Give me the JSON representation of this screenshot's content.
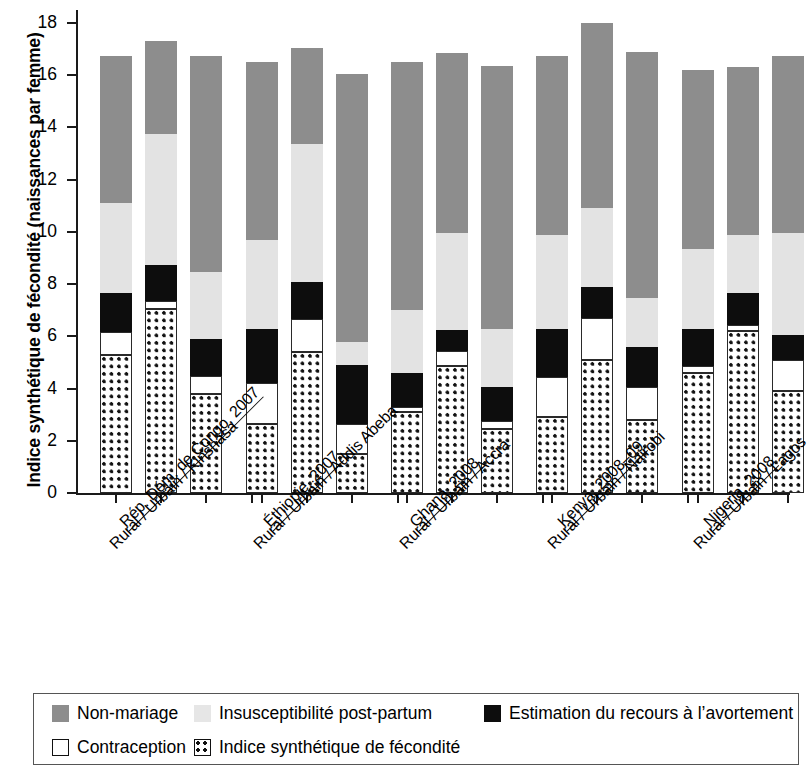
{
  "chart_data": {
    "type": "bar",
    "stacked": true,
    "title": "",
    "xlabel": "",
    "ylabel": "Indice synthétique de fécondité (naissances par femme)",
    "ylim": [
      0,
      18
    ],
    "yticks": [
      0,
      2,
      4,
      6,
      8,
      10,
      12,
      14,
      16,
      18
    ],
    "grid": false,
    "legend_position": "bottom",
    "series": [
      {
        "name": "Indice synthétique de fécondité",
        "key": "tfr",
        "color": "#ffffff",
        "pattern": "dotted-grid"
      },
      {
        "name": "Contraception",
        "key": "contraception",
        "color": "#ffffff",
        "pattern": "solid-outline"
      },
      {
        "name": "Estimation du recours à l’avortement",
        "key": "abortion",
        "color": "#0d0d0d",
        "pattern": "solid-black"
      },
      {
        "name": "Insusceptibilité post-partum",
        "key": "postpartum",
        "color": "#e3e3e3",
        "pattern": "light-stipple"
      },
      {
        "name": "Non-mariage",
        "key": "nonmarriage",
        "color": "#8d8d8d",
        "pattern": "dark-stipple"
      }
    ],
    "groups": [
      {
        "label_country": "Rép. Dém. de Congo, 2007",
        "label_bars": "Rural / Urbain / Kinshasa",
        "bars": [
          {
            "name": "Rural",
            "tfr": 5.3,
            "contraception": 0.85,
            "abortion": 1.5,
            "postpartum": 3.45,
            "nonmarriage": 5.65,
            "total": 16.75
          },
          {
            "name": "Urbain",
            "tfr": 7.05,
            "contraception": 0.3,
            "abortion": 1.4,
            "postpartum": 5.0,
            "nonmarriage": 3.55,
            "total": 17.3
          },
          {
            "name": "Kinshasa",
            "tfr": 3.8,
            "contraception": 0.7,
            "abortion": 1.4,
            "postpartum": 2.55,
            "nonmarriage": 8.3,
            "total": 16.75
          }
        ]
      },
      {
        "label_country": "Éthiopie, 2007",
        "label_bars": "Rural / Urbain / Addis Abeba",
        "bars": [
          {
            "name": "Rural",
            "tfr": 2.65,
            "contraception": 1.55,
            "abortion": 2.1,
            "postpartum": 3.4,
            "nonmarriage": 6.8,
            "total": 16.5
          },
          {
            "name": "Urbain",
            "tfr": 5.4,
            "contraception": 1.25,
            "abortion": 1.45,
            "postpartum": 5.25,
            "nonmarriage": 3.7,
            "total": 17.05
          },
          {
            "name": "Addis Abeba",
            "tfr": 1.5,
            "contraception": 1.15,
            "abortion": 2.25,
            "postpartum": 0.9,
            "nonmarriage": 10.25,
            "total": 16.05
          }
        ]
      },
      {
        "label_country": "Ghana, 2008",
        "label_bars": "Rural / Urbain / Accra",
        "bars": [
          {
            "name": "Rural",
            "tfr": 3.1,
            "contraception": 0.2,
            "abortion": 1.3,
            "postpartum": 2.4,
            "nonmarriage": 9.5,
            "total": 16.5
          },
          {
            "name": "Urbain",
            "tfr": 4.85,
            "contraception": 0.6,
            "abortion": 0.8,
            "postpartum": 3.7,
            "nonmarriage": 6.9,
            "total": 16.85
          },
          {
            "name": "Accra",
            "tfr": 2.45,
            "contraception": 0.3,
            "abortion": 1.3,
            "postpartum": 2.25,
            "nonmarriage": 10.05,
            "total": 16.35
          }
        ]
      },
      {
        "label_country": "Kenya, 2008–09",
        "label_bars": "Rural / Urbain / Nairobi",
        "bars": [
          {
            "name": "Rural",
            "tfr": 2.9,
            "contraception": 1.55,
            "abortion": 1.85,
            "postpartum": 3.6,
            "nonmarriage": 6.85,
            "total": 16.75
          },
          {
            "name": "Urbain",
            "tfr": 5.1,
            "contraception": 1.6,
            "abortion": 1.2,
            "postpartum": 3.0,
            "nonmarriage": 7.1,
            "total": 18.0
          },
          {
            "name": "Nairobi",
            "tfr": 2.8,
            "contraception": 1.25,
            "abortion": 1.55,
            "postpartum": 1.85,
            "nonmarriage": 9.45,
            "total": 16.9
          }
        ]
      },
      {
        "label_country": "Nigeria, 2008",
        "label_bars": "Rural / Urbain / Lagos",
        "bars": [
          {
            "name": "Rural",
            "tfr": 4.6,
            "contraception": 0.25,
            "abortion": 1.45,
            "postpartum": 3.05,
            "nonmarriage": 6.85,
            "total": 16.2
          },
          {
            "name": "Urbain",
            "tfr": 6.2,
            "contraception": 0.25,
            "abortion": 1.2,
            "postpartum": 2.25,
            "nonmarriage": 6.4,
            "total": 16.3
          },
          {
            "name": "Lagos",
            "tfr": 3.9,
            "contraception": 1.2,
            "abortion": 0.95,
            "postpartum": 3.9,
            "nonmarriage": 6.8,
            "total": 16.75
          }
        ]
      }
    ]
  },
  "axis": {
    "y_title": "Indice synthétique de fécondité (naissances par femme)",
    "tick_0": "0",
    "tick_2": "2",
    "tick_4": "4",
    "tick_6": "6",
    "tick_8": "8",
    "tick_10": "10",
    "tick_12": "12",
    "tick_14": "14",
    "tick_16": "16",
    "tick_18": "18"
  },
  "xlabels": [
    {
      "country": "Rép. Dém. de Congo, 2007",
      "bars": "Rural / Urbain / Kinshasa"
    },
    {
      "country": "Éthiopie, 2007",
      "bars": "Rural / Urbain / Addis Abeba"
    },
    {
      "country": "Ghana, 2008",
      "bars": "Rural / Urbain / Accra"
    },
    {
      "country": "Kenya, 2008–09",
      "bars": "Rural / Urbain / Nairobi"
    },
    {
      "country": "Nigeria, 2008",
      "bars": "Rural / Urbain / Lagos"
    }
  ],
  "legend": {
    "items": [
      {
        "label": "Non-mariage",
        "key": "nonmarriage"
      },
      {
        "label": "Insusceptibilité post-partum",
        "key": "postpartum"
      },
      {
        "label": "Estimation du recours à l’avortement",
        "key": "abortion"
      },
      {
        "label": "Contraception",
        "key": "contraception"
      },
      {
        "label": "Indice synthétique de fécondité",
        "key": "tfr"
      }
    ]
  }
}
